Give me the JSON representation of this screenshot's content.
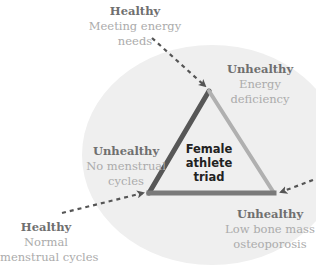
{
  "diagram": {
    "title": "Female athlete triad",
    "center_lines": [
      "Female",
      "athlete",
      "triad"
    ],
    "colors": {
      "circle_fill": "#efefef",
      "edge_left": "#575757",
      "edge_right": "#b0b0b0",
      "edge_bottom": "#7a7a7a",
      "arrow": "#555555",
      "state_text": "#6f6f6f",
      "desc_text": "#ababab"
    },
    "unhealthy": [
      {
        "state": "Unhealthy",
        "lines": [
          "Energy",
          "deficiency"
        ]
      },
      {
        "state": "Unhealthy",
        "lines": [
          "No menstrual",
          "cycles"
        ]
      },
      {
        "state": "Unhealthy",
        "lines": [
          "Low bone mass",
          "osteoporosis"
        ]
      }
    ],
    "healthy": [
      {
        "state": "Healthy",
        "lines": [
          "Meeting energy",
          "needs"
        ]
      },
      {
        "state": "Healthy",
        "lines": [
          "Normal",
          "menstrual cycles"
        ]
      }
    ]
  }
}
